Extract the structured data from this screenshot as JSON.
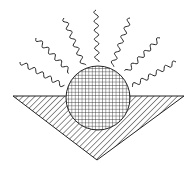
{
  "diagram": {
    "colors": {
      "stroke": "#222222",
      "background": "#ffffff"
    },
    "sun": {
      "center": [
        98,
        98
      ],
      "radius": 32,
      "fill_pattern": "crosshatch-grid"
    },
    "triangle": {
      "points": [
        [
          13,
          96
        ],
        [
          184,
          96
        ],
        [
          97,
          160
        ]
      ],
      "fill_pattern": "diagonal-hatch"
    },
    "rays": [
      {
        "from": [
          20,
          62
        ],
        "to": [
          64,
          86
        ]
      },
      {
        "from": [
          36,
          38
        ],
        "to": [
          70,
          72
        ]
      },
      {
        "from": [
          64,
          18
        ],
        "to": [
          84,
          66
        ]
      },
      {
        "from": [
          96,
          10
        ],
        "to": [
          97,
          62
        ]
      },
      {
        "from": [
          130,
          18
        ],
        "to": [
          112,
          66
        ]
      },
      {
        "from": [
          160,
          38
        ],
        "to": [
          126,
          72
        ]
      },
      {
        "from": [
          176,
          62
        ],
        "to": [
          132,
          86
        ]
      }
    ]
  }
}
